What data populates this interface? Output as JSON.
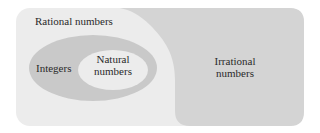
{
  "diagram": {
    "type": "venn-nested",
    "regions": [
      {
        "id": "rational",
        "label": "Rational numbers",
        "color": "#ececec"
      },
      {
        "id": "integers",
        "label": "Integers",
        "color": "#c9c9c9"
      },
      {
        "id": "natural",
        "label_line1": "Natural",
        "label_line2": "numbers",
        "color": "#ececec"
      },
      {
        "id": "irrational",
        "label_line1": "Irrational",
        "label_line2": "numbers",
        "color": "#d4d4d4"
      }
    ],
    "relations": [
      "Natural numbers ⊂ Integers",
      "Integers ⊂ Rational numbers",
      "Rational numbers and Irrational numbers are disjoint"
    ]
  }
}
